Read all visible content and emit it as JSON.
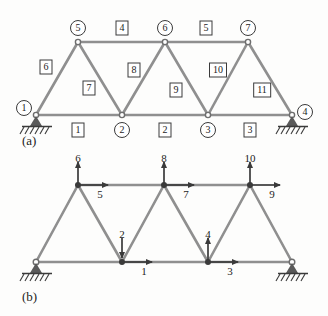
{
  "figure": {
    "panels": [
      {
        "id": "a",
        "label": "(a)",
        "caption_x": 30,
        "caption_y": 140
      },
      {
        "id": "b",
        "label": "(b)",
        "caption_x": 30,
        "caption_y": 296
      }
    ]
  },
  "panel_a": {
    "description": "Plane truss with numbered nodes in circles and numbered elements in squares",
    "nodes": [
      {
        "label": "1",
        "x": 36,
        "y": 115,
        "label_x": 24,
        "label_y": 108,
        "support": "pin"
      },
      {
        "label": "2",
        "x": 122,
        "y": 115,
        "label_x": 122,
        "label_y": 130,
        "support": "none"
      },
      {
        "label": "3",
        "x": 208,
        "y": 115,
        "label_x": 208,
        "label_y": 130,
        "support": "none"
      },
      {
        "label": "4",
        "x": 292,
        "y": 115,
        "label_x": 305,
        "label_y": 112,
        "support": "pin"
      },
      {
        "label": "5",
        "x": 78,
        "y": 42,
        "label_x": 78,
        "label_y": 28,
        "support": "none"
      },
      {
        "label": "6",
        "x": 165,
        "y": 42,
        "label_x": 165,
        "label_y": 28,
        "support": "none"
      },
      {
        "label": "7",
        "x": 248,
        "y": 42,
        "label_x": 248,
        "label_y": 28,
        "support": "none"
      }
    ],
    "elements": [
      {
        "label": "1",
        "from": "1",
        "to": "2",
        "label_x": 78,
        "label_y": 130
      },
      {
        "label": "2",
        "from": "2",
        "to": "3",
        "label_x": 165,
        "label_y": 130
      },
      {
        "label": "3",
        "from": "3",
        "to": "4",
        "label_x": 250,
        "label_y": 130
      },
      {
        "label": "4",
        "from": "5",
        "to": "6",
        "label_x": 122,
        "label_y": 28
      },
      {
        "label": "5",
        "from": "6",
        "to": "7",
        "label_x": 206,
        "label_y": 28
      },
      {
        "label": "6",
        "from": "1",
        "to": "5",
        "label_x": 46,
        "label_y": 67
      },
      {
        "label": "7",
        "from": "5",
        "to": "2",
        "label_x": 89,
        "label_y": 88
      },
      {
        "label": "8",
        "from": "2",
        "to": "6",
        "label_x": 134,
        "label_y": 70
      },
      {
        "label": "9",
        "from": "6",
        "to": "3",
        "label_x": 176,
        "label_y": 90
      },
      {
        "label": "10",
        "from": "3",
        "to": "7",
        "label_x": 218,
        "label_y": 70
      },
      {
        "label": "11",
        "from": "7",
        "to": "4",
        "label_x": 262,
        "label_y": 90
      }
    ]
  },
  "panel_b": {
    "description": "Same truss showing global degrees of freedom as numbered arrows",
    "nodes": [
      {
        "x": 36,
        "y": 262,
        "support": "pin",
        "solid": false
      },
      {
        "x": 122,
        "y": 262,
        "support": "none",
        "solid": true
      },
      {
        "x": 208,
        "y": 262,
        "support": "none",
        "solid": true
      },
      {
        "x": 292,
        "y": 262,
        "support": "pin",
        "solid": false
      },
      {
        "x": 78,
        "y": 185,
        "support": "none",
        "solid": true
      },
      {
        "x": 164,
        "y": 185,
        "support": "none",
        "solid": true
      },
      {
        "x": 250,
        "y": 185,
        "support": "none",
        "solid": true
      }
    ],
    "dofs": [
      {
        "label": "1",
        "dir": "right",
        "node_x": 122,
        "node_y": 262,
        "label_x": 144,
        "label_y": 271
      },
      {
        "label": "2",
        "dir": "down",
        "node_x": 122,
        "node_y": 262,
        "label_x": 122,
        "label_y": 234
      },
      {
        "label": "3",
        "dir": "right",
        "node_x": 208,
        "node_y": 262,
        "label_x": 230,
        "label_y": 271
      },
      {
        "label": "4",
        "dir": "up",
        "node_x": 208,
        "node_y": 262,
        "label_x": 208,
        "label_y": 234
      },
      {
        "label": "5",
        "dir": "right",
        "node_x": 78,
        "node_y": 185,
        "label_x": 100,
        "label_y": 194
      },
      {
        "label": "6",
        "dir": "up",
        "node_x": 78,
        "node_y": 185,
        "label_x": 78,
        "label_y": 158
      },
      {
        "label": "7",
        "dir": "right",
        "node_x": 164,
        "node_y": 185,
        "label_x": 186,
        "label_y": 194
      },
      {
        "label": "8",
        "dir": "up",
        "node_x": 164,
        "node_y": 185,
        "label_x": 164,
        "label_y": 158
      },
      {
        "label": "9",
        "dir": "right",
        "node_x": 250,
        "node_y": 185,
        "label_x": 272,
        "label_y": 194
      },
      {
        "label": "10",
        "dir": "up",
        "node_x": 250,
        "node_y": 185,
        "label_x": 250,
        "label_y": 158
      }
    ]
  },
  "colors": {
    "member": "#8f8f8f",
    "ink": "#1d1d1d",
    "support_fill": "#5a5a5a",
    "node_stroke": "#6e6e6e",
    "paper": "#fdfdfc"
  }
}
